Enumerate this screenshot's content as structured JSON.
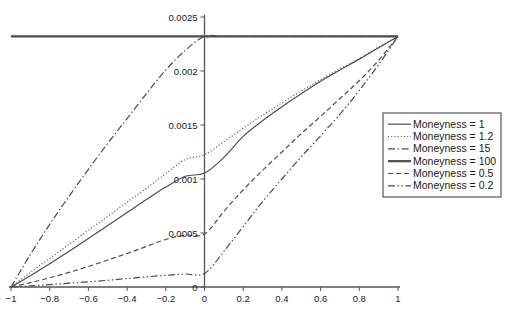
{
  "chart_data": {
    "type": "line",
    "title": "",
    "xlabel": "",
    "ylabel": "",
    "xlim": [
      -1,
      1
    ],
    "ylim": [
      0,
      0.0025
    ],
    "grid": false,
    "legend_position": "right",
    "x_ticks": [
      "-1",
      "-0.8",
      "-0.6",
      "-0.4",
      "-0.2",
      "0",
      "0.2",
      "0.4",
      "0.6",
      "0.8",
      "1"
    ],
    "x_tick_values": [
      -1,
      -0.8,
      -0.6,
      -0.4,
      -0.2,
      0,
      0.2,
      0.4,
      0.6,
      0.8,
      1
    ],
    "y_ticks": [
      "0",
      "0.0005",
      "0.001",
      "0.0015",
      "0.002",
      "0.0025"
    ],
    "y_tick_values": [
      0,
      0.0005,
      0.001,
      0.0015,
      0.002,
      0.0025
    ],
    "x": [
      -1,
      -0.9,
      -0.8,
      -0.7,
      -0.6,
      -0.5,
      -0.4,
      -0.3,
      -0.2,
      -0.1,
      0,
      0.1,
      0.2,
      0.3,
      0.4,
      0.5,
      0.6,
      0.7,
      0.8,
      0.9,
      1
    ],
    "series": [
      {
        "name": "Moneyness = 1",
        "style": "solid",
        "width": 1.2,
        "values": [
          0,
          0.000105,
          0.000215,
          0.00033,
          0.00045,
          0.00057,
          0.00069,
          0.00081,
          0.000925,
          0.001025,
          0.001055,
          0.0012,
          0.001395,
          0.00154,
          0.00167,
          0.00179,
          0.001905,
          0.00201,
          0.00211,
          0.002215,
          0.00232
        ]
      },
      {
        "name": "Moneyness = 1.2",
        "style": "dotted",
        "width": 1.2,
        "values": [
          0,
          0.000135,
          0.000265,
          0.000395,
          0.000525,
          0.000655,
          0.000785,
          0.000915,
          0.00105,
          0.00118,
          0.001225,
          0.001345,
          0.00147,
          0.00159,
          0.001705,
          0.001815,
          0.00192,
          0.00202,
          0.002115,
          0.00222,
          0.00232
        ]
      },
      {
        "name": "Moneyness = 15",
        "style": "dashdot",
        "width": 1.2,
        "values": [
          0,
          0.0003,
          0.00058,
          0.00084,
          0.00109,
          0.00133,
          0.00156,
          0.00179,
          0.00201,
          0.00219,
          0.00232,
          0.00232,
          0.00232,
          0.00232,
          0.00232,
          0.00232,
          0.00232,
          0.00232,
          0.00232,
          0.00232,
          0.00232
        ]
      },
      {
        "name": "Moneyness = 100",
        "style": "solid",
        "width": 2.2,
        "values": [
          0.00232,
          0.00232,
          0.00232,
          0.00232,
          0.00232,
          0.00232,
          0.00232,
          0.00232,
          0.00232,
          0.00232,
          0.00232,
          0.00232,
          0.00232,
          0.00232,
          0.00232,
          0.00232,
          0.00232,
          0.00232,
          0.00232,
          0.00232,
          0.00232
        ]
      },
      {
        "name": "Moneyness = 0.5",
        "style": "dashed",
        "width": 1.2,
        "values": [
          0,
          4e-05,
          8.5e-05,
          0.000135,
          0.00019,
          0.00025,
          0.00031,
          0.000375,
          0.00044,
          0.00048,
          0.00049,
          0.0007,
          0.0009,
          0.00108,
          0.00125,
          0.00142,
          0.00158,
          0.001745,
          0.00191,
          0.0021,
          0.00232
        ]
      },
      {
        "name": "Moneyness = 0.2",
        "style": "dashdotdot",
        "width": 1.2,
        "values": [
          0,
          1e-05,
          2.2e-05,
          3.5e-05,
          4.8e-05,
          6.2e-05,
          7.8e-05,
          9.4e-05,
          0.000108,
          0.00012,
          0.000125,
          0.00033,
          0.00056,
          0.00079,
          0.001,
          0.001205,
          0.0014,
          0.0016,
          0.00182,
          0.00206,
          0.00232
        ]
      }
    ],
    "legend_entries": [
      "Moneyness = 1",
      "Moneyness = 1.2",
      "Moneyness = 15",
      "Moneyness = 100",
      "Moneyness = 0.5",
      "Moneyness = 0.2"
    ],
    "axis_color": "#555555",
    "line_color": "#4d4d4d",
    "legend_border_color": "#555555"
  }
}
